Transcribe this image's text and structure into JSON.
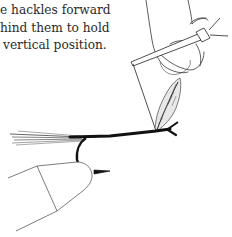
{
  "document": {
    "text_lines": [
      "e hackles forward",
      "hind them to hold",
      "vertical position."
    ]
  },
  "illustration": {
    "subject": "fly-tying-step",
    "elements": [
      "hand-holding-tool",
      "hackle-feather",
      "hook-shank-with-tail",
      "vise-jaws"
    ],
    "line_color": "#1a1a1a"
  }
}
